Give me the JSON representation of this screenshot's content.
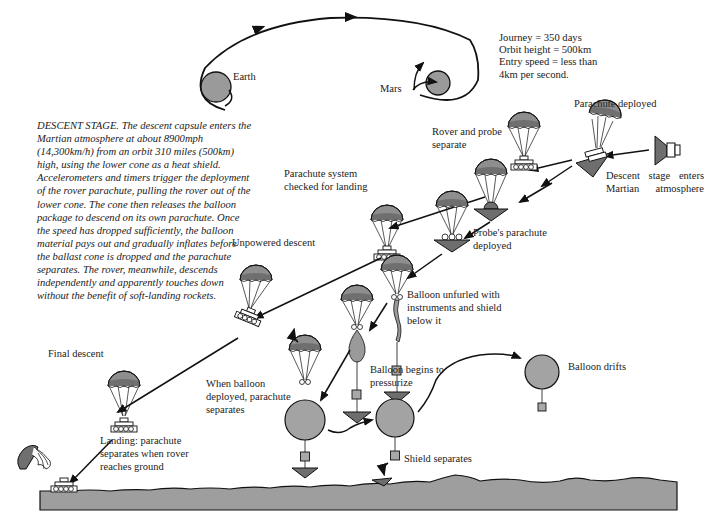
{
  "colors": {
    "planet_fill": "#9a9a9a",
    "canopy_top": "#8e8e8e",
    "canopy_band": "#6f6f6f",
    "ground_fill": "#9e9e9e",
    "balloon_fill": "#a3a3a3",
    "shield_fill": "#6e6e6e",
    "line": "#111111",
    "background": "#ffffff"
  },
  "trajectory": {
    "earth_label": "Earth",
    "mars_label": "Mars"
  },
  "facts": {
    "line1": "Journey = 350 days",
    "line2": "Orbit height = 500km",
    "line3": "Entry speed = less than",
    "line4": "4km per second."
  },
  "caption": {
    "text": "DESCENT STAGE. The descent capsule enters the Martian atmosphere at about 8900mph (14,300km/h) from an orbit 310 miles (500km) high, using the lower cone as a heat shield. Accelerometers and timers trigger the deployment of the rover parachute, pulling the rover out of the lower cone. The cone then releases the balloon package to descend on its own parachute. Once the speed has dropped sufficiently, the balloon material pays out and gradually inflates before the ballast cone is dropped and the parachute separates. The rover, meanwhile, descends independently and apparently touches down without the benefit of soft-landing rockets."
  },
  "stages": [
    {
      "id": "descent-stage-enters",
      "label": "Descent stage enters Martian atmosphere"
    },
    {
      "id": "parachute-deployed",
      "label": "Parachute deployed"
    },
    {
      "id": "rover-probe-separate",
      "label": "Rover and probe separate"
    },
    {
      "id": "parachute-system-checked",
      "label": "Parachute system checked for landing"
    },
    {
      "id": "probe-parachute-deployed",
      "label": "Probe's parachute deployed"
    },
    {
      "id": "unpowered-descent",
      "label": "Unpowered descent"
    },
    {
      "id": "balloon-unfurled",
      "label": "Balloon unfurled with instruments and shield below it"
    },
    {
      "id": "balloon-pressurize",
      "label": "Balloon begins to pressurize"
    },
    {
      "id": "final-descent",
      "label": "Final descent"
    },
    {
      "id": "balloon-deployed-parachute-separates",
      "label": "When balloon deployed, parachute separates"
    },
    {
      "id": "balloon-drifts",
      "label": "Balloon drifts"
    },
    {
      "id": "shield-separates",
      "label": "Shield separates"
    },
    {
      "id": "landing",
      "label": "Landing: parachute separates when rover reaches ground"
    }
  ]
}
